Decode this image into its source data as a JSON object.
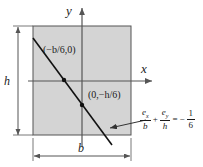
{
  "figure": {
    "colors": {
      "section_fill": "#d4d4d4",
      "stroke": "#555555",
      "text": "#1a1a1a",
      "background": "#ffffff"
    },
    "axes": {
      "y_label": "y",
      "x_label": "x"
    },
    "dimensions": {
      "height_label": "h",
      "width_label": "b"
    },
    "points": [
      {
        "name": "x-intercept",
        "label": "(−b/6,0)"
      },
      {
        "name": "y-intercept",
        "label": "(0,−h/6)"
      }
    ],
    "equation": {
      "term1": {
        "numerator": "e",
        "numerator_sub": "x",
        "denominator": "b"
      },
      "operator1": "+",
      "term2": {
        "numerator": "e",
        "numerator_sub": "y",
        "denominator": "h"
      },
      "operator2": "=",
      "sign": "−",
      "term3": {
        "numerator": "1",
        "denominator": "6"
      }
    }
  }
}
